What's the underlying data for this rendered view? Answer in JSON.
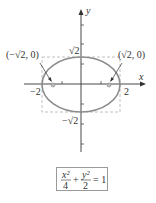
{
  "diagram": {
    "type": "ellipse-graph",
    "axes": {
      "x_label": "x",
      "y_label": "y"
    },
    "labels": {
      "left_focus": "(−√2, 0)",
      "right_focus": "(√2, 0)",
      "top": "√2",
      "bottom": "−√2",
      "left": "−2",
      "right": "2"
    },
    "equation": {
      "term1_num": "x²",
      "term1_den": "4",
      "plus": "+",
      "term2_num": "y²",
      "term2_den": "2",
      "rhs": "= 1"
    },
    "colors": {
      "ellipse": "#8c8c8c",
      "axes": "#333333",
      "dashed_box": "#b0b0b0",
      "foci": "#999999"
    }
  }
}
